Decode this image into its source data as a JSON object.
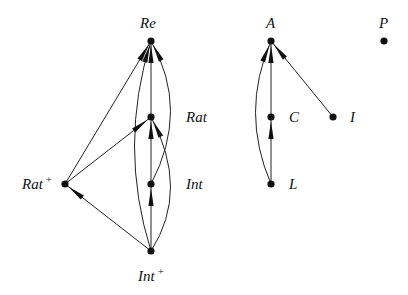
{
  "diagram": {
    "type": "hasse-diagram",
    "nodes": [
      {
        "id": "Re",
        "label": "Re",
        "x": 151,
        "y": 41,
        "label_x": 140,
        "label_y": 28
      },
      {
        "id": "Rat",
        "label": "Rat",
        "x": 151,
        "y": 117,
        "label_x": 186,
        "label_y": 122
      },
      {
        "id": "Int",
        "label": "Int",
        "x": 151,
        "y": 184,
        "label_x": 186,
        "label_y": 189
      },
      {
        "id": "IntPlus",
        "label": "Int",
        "sup": "+",
        "x": 151,
        "y": 251,
        "label_x": 138,
        "label_y": 281
      },
      {
        "id": "RatPlus",
        "label": "Rat",
        "sup": "+",
        "x": 65,
        "y": 184,
        "label_x": 22,
        "label_y": 189
      },
      {
        "id": "A",
        "label": "A",
        "x": 271,
        "y": 41,
        "label_x": 266,
        "label_y": 28
      },
      {
        "id": "C",
        "label": "C",
        "x": 271,
        "y": 117,
        "label_x": 289,
        "label_y": 122
      },
      {
        "id": "I",
        "label": "I",
        "x": 333,
        "y": 117,
        "label_x": 350,
        "label_y": 122
      },
      {
        "id": "L",
        "label": "L",
        "x": 271,
        "y": 184,
        "label_x": 289,
        "label_y": 189
      },
      {
        "id": "P",
        "label": "P",
        "x": 384,
        "y": 41,
        "label_x": 379,
        "label_y": 28
      }
    ],
    "edges": [
      {
        "from": "RatPlus",
        "to": "Re",
        "shape": "straight"
      },
      {
        "from": "IntPlus",
        "to": "Re",
        "shape": "curve",
        "ctrl": [
          118,
          146
        ]
      },
      {
        "from": "Rat",
        "to": "Re",
        "shape": "straight"
      },
      {
        "from": "Int",
        "to": "Re",
        "shape": "curve",
        "ctrl": [
          190,
          110
        ]
      },
      {
        "from": "RatPlus",
        "to": "Rat",
        "shape": "straight"
      },
      {
        "from": "Int",
        "to": "Rat",
        "shape": "straight"
      },
      {
        "from": "IntPlus",
        "to": "Rat",
        "shape": "curve",
        "ctrl": [
          190,
          190
        ]
      },
      {
        "from": "IntPlus",
        "to": "Int",
        "shape": "straight"
      },
      {
        "from": "IntPlus",
        "to": "RatPlus",
        "shape": "straight"
      },
      {
        "from": "C",
        "to": "A",
        "shape": "straight"
      },
      {
        "from": "L",
        "to": "C",
        "shape": "straight"
      },
      {
        "from": "L",
        "to": "A",
        "shape": "curve",
        "ctrl": [
          240,
          112
        ]
      },
      {
        "from": "I",
        "to": "A",
        "shape": "straight"
      }
    ]
  }
}
